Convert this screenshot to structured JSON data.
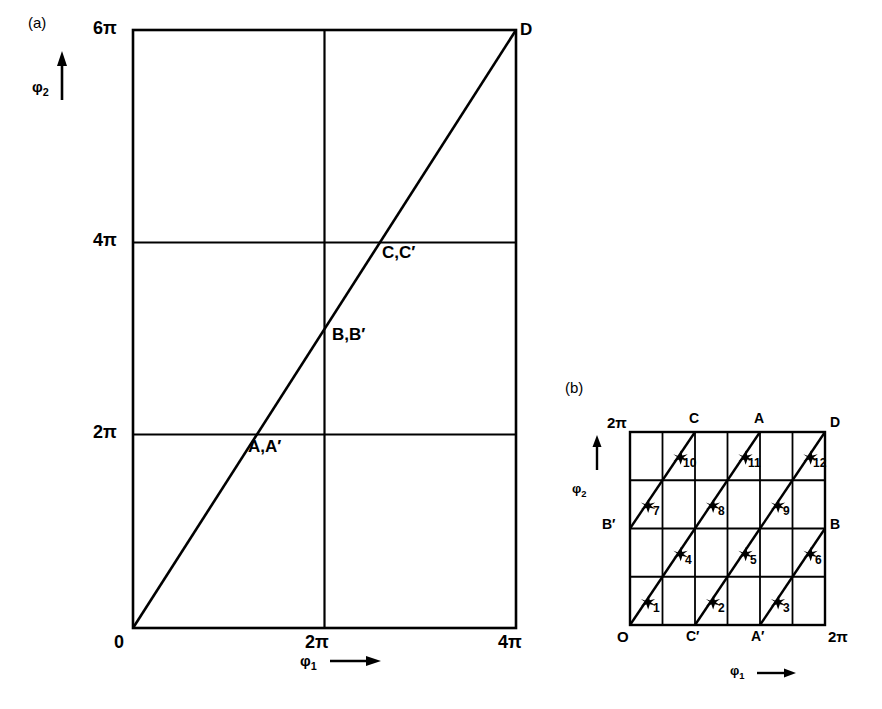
{
  "figure": {
    "background": "#ffffff",
    "ink": "#000000",
    "panels": [
      {
        "id": "a",
        "tag": "(a)",
        "tag_pos": [
          33,
          16
        ],
        "plot_box": {
          "x": 133,
          "y": 30,
          "w": 383,
          "h": 598
        },
        "x_axis": {
          "name": "φ",
          "name_sub": "1",
          "arrow": "⟶",
          "ticks": [
            {
              "label": "0",
              "value": 0,
              "px": 133
            },
            {
              "label": "2π",
              "value": 6.2832,
              "px": 324
            },
            {
              "label": "4π",
              "value": 12.5664,
              "px": 516
            }
          ],
          "range": [
            0,
            12.5664
          ]
        },
        "y_axis": {
          "name": "φ",
          "name_sub": "2",
          "arrow": "↑",
          "ticks": [
            {
              "label": "0",
              "value": 0,
              "px": 628
            },
            {
              "label": "2π",
              "value": 6.2832,
              "px": 434
            },
            {
              "label": "4π",
              "value": 12.5664,
              "px": 242
            },
            {
              "label": "6π",
              "value": 18.8496,
              "px": 30
            }
          ],
          "range": [
            0,
            18.8496
          ]
        },
        "gridlines": {
          "vertical": [
            6.2832
          ],
          "horizontal": [
            6.2832,
            12.5664
          ]
        },
        "diagonal": {
          "from": [
            0,
            0
          ],
          "to": [
            12.5664,
            18.8496
          ],
          "description": "straight line from origin to top-right corner"
        },
        "point_labels": [
          {
            "text": "A,A′",
            "x": 248,
            "y": 437,
            "anchor": "topleft"
          },
          {
            "text": "B,B′",
            "x": 332,
            "y": 325,
            "anchor": "topleft"
          },
          {
            "text": "C,C′",
            "x": 382,
            "y": 243,
            "anchor": "topleft"
          },
          {
            "text": "D",
            "x": 520,
            "y": 22,
            "anchor": "topleft"
          }
        ]
      },
      {
        "id": "b",
        "tag": "(b)",
        "tag_pos": [
          570,
          381
        ],
        "plot_box": {
          "x": 630,
          "y": 432,
          "w": 195,
          "h": 193
        },
        "grid": {
          "cols": 6,
          "rows": 4
        },
        "x_axis": {
          "name": "φ",
          "name_sub": "1",
          "arrow": "⟶",
          "ticks": [
            {
              "label": "0",
              "value": 0,
              "px": 630
            },
            {
              "label": "2π",
              "value": 6.2832,
              "px": 825
            }
          ],
          "range": [
            0,
            6.2832
          ]
        },
        "y_axis": {
          "name": "φ",
          "name_sub": "2",
          "arrow": "↑",
          "ticks": [
            {
              "label": "2π",
              "value": 6.2832,
              "px": 432
            }
          ],
          "range": [
            0,
            6.2832
          ]
        },
        "edge_labels": [
          {
            "text": "C",
            "side": "top",
            "col": 2
          },
          {
            "text": "A",
            "side": "top",
            "col": 4
          },
          {
            "text": "D",
            "side": "top",
            "col": 6
          },
          {
            "text": "C′",
            "side": "bottom",
            "col": 2
          },
          {
            "text": "A′",
            "side": "bottom",
            "col": 4
          },
          {
            "text": "O",
            "side": "bottom",
            "col": 0
          },
          {
            "text": "B′",
            "side": "left",
            "row": 2
          },
          {
            "text": "B",
            "side": "right",
            "row": 2
          }
        ],
        "segments": [
          {
            "n": "1",
            "col": 0,
            "row": 0
          },
          {
            "n": "2",
            "col": 2,
            "row": 0
          },
          {
            "n": "3",
            "col": 4,
            "row": 0
          },
          {
            "n": "4",
            "col": 1,
            "row": 1
          },
          {
            "n": "5",
            "col": 3,
            "row": 1
          },
          {
            "n": "6",
            "col": 5,
            "row": 1
          },
          {
            "n": "7",
            "col": 0,
            "row": 2
          },
          {
            "n": "8",
            "col": 2,
            "row": 2
          },
          {
            "n": "9",
            "col": 4,
            "row": 2
          },
          {
            "n": "10",
            "col": 1,
            "row": 3
          },
          {
            "n": "11",
            "col": 3,
            "row": 3
          },
          {
            "n": "12",
            "col": 5,
            "row": 3
          }
        ],
        "marker": "star"
      }
    ]
  }
}
